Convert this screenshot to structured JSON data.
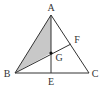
{
  "diagram": {
    "type": "geometry",
    "points": {
      "A": {
        "label": "A",
        "x": 51,
        "y": 15,
        "lx": 51,
        "ly": 11
      },
      "B": {
        "label": "B",
        "x": 15,
        "y": 73,
        "lx": 7,
        "ly": 77
      },
      "C": {
        "label": "C",
        "x": 89,
        "y": 73,
        "lx": 95,
        "ly": 77
      },
      "E": {
        "label": "E",
        "x": 51,
        "y": 73,
        "lx": 51,
        "ly": 85
      },
      "F": {
        "label": "F",
        "x": 71,
        "y": 44,
        "lx": 77,
        "ly": 43
      },
      "G": {
        "label": "G",
        "x": 51,
        "y": 53,
        "lx": 59,
        "ly": 61
      }
    },
    "segments": [
      [
        "A",
        "B"
      ],
      [
        "B",
        "C"
      ],
      [
        "C",
        "A"
      ],
      [
        "A",
        "E"
      ],
      [
        "B",
        "F"
      ]
    ],
    "shaded_region": [
      "A",
      "B",
      "G"
    ],
    "colors": {
      "line": "#333333",
      "shade": "#c8c8c8",
      "point": "#111111",
      "background": "#ffffff"
    }
  }
}
